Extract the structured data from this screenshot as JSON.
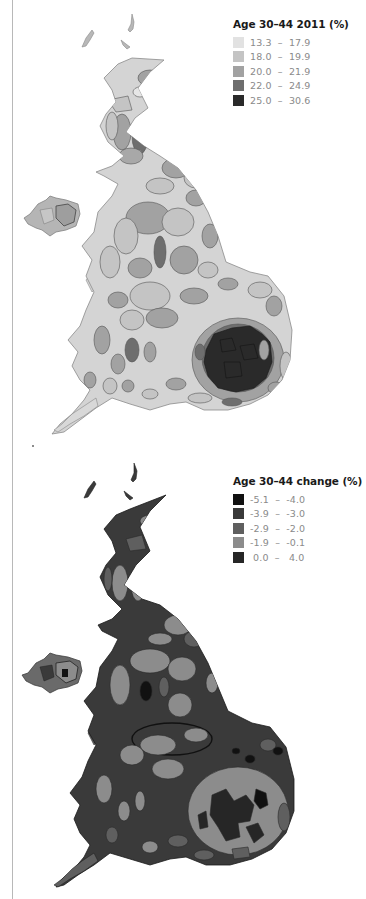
{
  "maps": [
    {
      "id": "age-30-44-2011",
      "legend": {
        "title": "Age 30–44 2011 (%)",
        "items": [
          {
            "label": "13.3  –  17.9",
            "min": 13.3,
            "max": 17.9,
            "color": "#e2e2e2"
          },
          {
            "label": "18.0  –  19.9",
            "min": 18.0,
            "max": 19.9,
            "color": "#c4c4c4"
          },
          {
            "label": "20.0  –  21.9",
            "min": 20.0,
            "max": 21.9,
            "color": "#a2a2a2"
          },
          {
            "label": "22.0  –  24.9",
            "min": 22.0,
            "max": 24.9,
            "color": "#6e6e6e"
          },
          {
            "label": "25.0  –  30.6",
            "min": 25.0,
            "max": 30.6,
            "color": "#2a2a2a"
          }
        ]
      }
    },
    {
      "id": "age-30-44-change",
      "legend": {
        "title": "Age 30–44 change (%)",
        "items": [
          {
            "label": "-5.1  –  -4.0",
            "min": -5.1,
            "max": -4.0,
            "color": "#111111"
          },
          {
            "label": "-3.9  –  -3.0",
            "min": -3.9,
            "max": -3.0,
            "color": "#3a3a3a"
          },
          {
            "label": "-2.9  –  -2.0",
            "min": -2.9,
            "max": -2.0,
            "color": "#5f5f5f"
          },
          {
            "label": "-1.9  –  -0.1",
            "min": -1.9,
            "max": -0.1,
            "color": "#8c8c8c"
          },
          {
            "label": " 0.0  –   4.0",
            "min": 0.0,
            "max": 4.0,
            "color": "#262626"
          }
        ]
      }
    }
  ]
}
